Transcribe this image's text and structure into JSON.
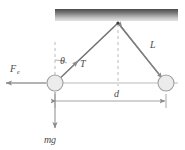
{
  "figure": {
    "type": "physics-free-body-diagram",
    "colors": {
      "ceiling_dark": "#4f4f4f",
      "ceiling_light": "#d8d8d8",
      "string": "#6b6b6b",
      "ball_fill": "#ececec",
      "ball_stroke": "#9a9a9a",
      "dashed": "#b4b4b4",
      "arrow": "#8a8a8a",
      "text": "#4a4a4a"
    }
  },
  "labels": {
    "theta": "θ",
    "tension": "T",
    "length": "L",
    "separation": "d",
    "electric_force": "F",
    "electric_force_sub": "e",
    "weight_m": "m",
    "weight_g": "g"
  },
  "geometry": {
    "pivot": {
      "x": 118,
      "y": 23
    },
    "left_ball": {
      "x": 55,
      "y": 83,
      "r": 8
    },
    "right_ball": {
      "x": 166,
      "y": 83,
      "r": 8
    },
    "ceiling": {
      "x": 55,
      "y": 9,
      "width": 123,
      "height": 12
    },
    "separation_line_y": 101,
    "weight_arrow_end_y": 128,
    "force_arrow_end_x": 6
  },
  "label_positions": {
    "theta": {
      "x": 60,
      "y": 64
    },
    "tension": {
      "x": 79,
      "y": 66
    },
    "length": {
      "x": 151,
      "y": 48
    },
    "separation": {
      "x": 114,
      "y": 97
    },
    "electric_force": {
      "x": 11,
      "y": 71
    },
    "weight": {
      "x": 46,
      "y": 143
    }
  }
}
